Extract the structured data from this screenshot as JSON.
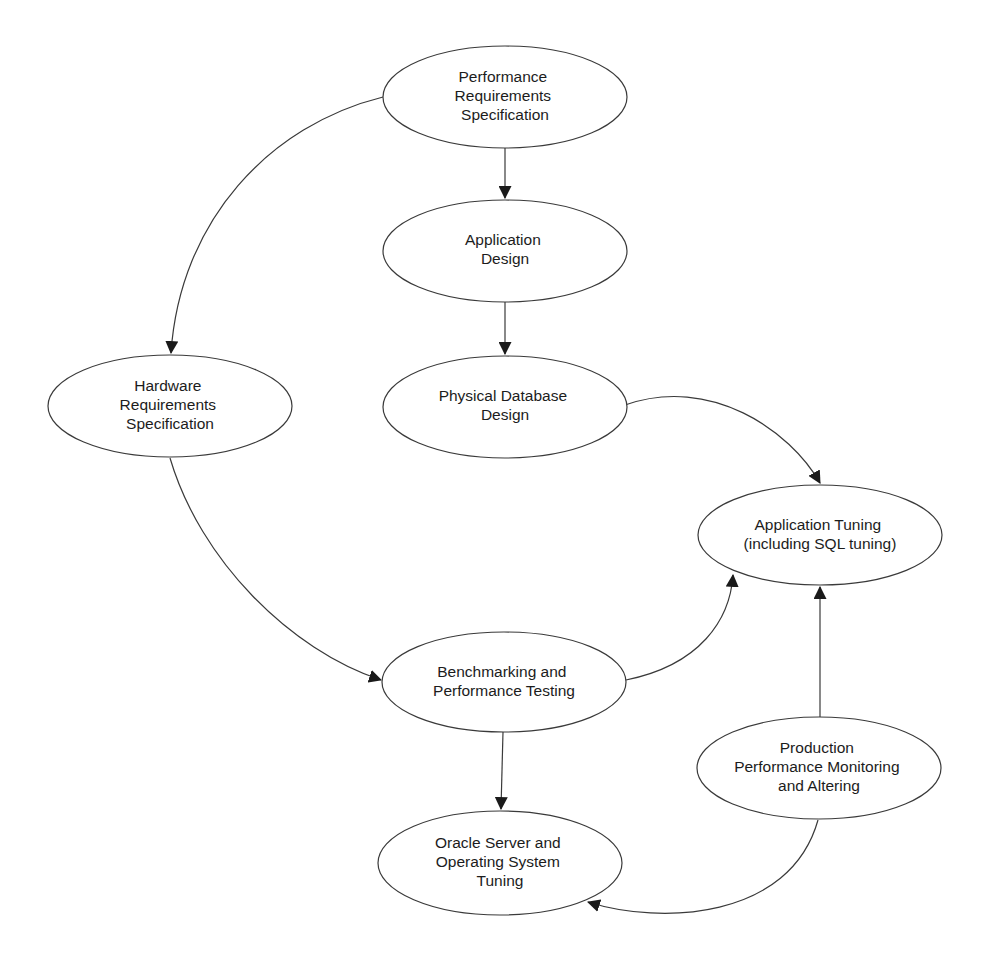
{
  "diagram": {
    "type": "flowchart",
    "style": {
      "stroke_color": "#3a3a3a",
      "text_color": "#1c1c1c",
      "background": "#ffffff"
    },
    "nodes": [
      {
        "id": "perf_req",
        "lines": [
          "Performance",
          "Requirements",
          "Specification"
        ],
        "cx": 505,
        "cy": 97,
        "rx": 122,
        "ry": 51
      },
      {
        "id": "app_design",
        "lines": [
          "Application",
          "Design"
        ],
        "cx": 505,
        "cy": 251,
        "rx": 122,
        "ry": 51
      },
      {
        "id": "phys_db",
        "lines": [
          "Physical Database",
          "Design"
        ],
        "cx": 505,
        "cy": 407,
        "rx": 122,
        "ry": 51
      },
      {
        "id": "hw_req",
        "lines": [
          "Hardware",
          "Requirements",
          "Specification"
        ],
        "cx": 170,
        "cy": 406,
        "rx": 122,
        "ry": 51
      },
      {
        "id": "app_tuning",
        "lines": [
          "Application Tuning",
          "(including SQL tuning)"
        ],
        "cx": 820,
        "cy": 535,
        "rx": 122,
        "ry": 50
      },
      {
        "id": "benchmark",
        "lines": [
          "Benchmarking and",
          "Performance Testing"
        ],
        "cx": 504,
        "cy": 682,
        "rx": 122,
        "ry": 50
      },
      {
        "id": "prod_monitor",
        "lines": [
          "Production",
          "Performance Monitoring",
          "and Altering"
        ],
        "cx": 819,
        "cy": 768,
        "rx": 122,
        "ry": 51
      },
      {
        "id": "oracle_tuning",
        "lines": [
          "Oracle Server and",
          "Operating System",
          "Tuning"
        ],
        "cx": 500,
        "cy": 863,
        "rx": 122,
        "ry": 52
      }
    ],
    "edges": [
      {
        "from": "perf_req",
        "to": "app_design",
        "path": "M505 148 L505 198"
      },
      {
        "from": "app_design",
        "to": "phys_db",
        "path": "M505 302 L505 354"
      },
      {
        "from": "perf_req",
        "to": "hw_req",
        "path": "M383 97 C 270 125, 180 220, 171 353"
      },
      {
        "from": "phys_db",
        "to": "app_tuning",
        "path": "M625 405 C 710 375, 790 430, 820 483"
      },
      {
        "from": "hw_req",
        "to": "benchmark",
        "path": "M170 458 C 200 560, 290 650, 381 680"
      },
      {
        "from": "benchmark",
        "to": "app_tuning",
        "path": "M626 680 C 700 665, 730 620, 733 575"
      },
      {
        "from": "prod_monitor",
        "to": "app_tuning",
        "path": "M820 717 L820 587"
      },
      {
        "from": "benchmark",
        "to": "oracle_tuning",
        "path": "M503 732 L501 809"
      },
      {
        "from": "prod_monitor",
        "to": "oracle_tuning",
        "path": "M818 820 C 790 920, 660 925, 588 902"
      }
    ]
  },
  "labels": {
    "perf_req": [
      "Performance",
      "Requirements",
      "Specification"
    ],
    "app_design": [
      "Application",
      "Design"
    ],
    "phys_db": [
      "Physical Database",
      "Design"
    ],
    "hw_req": [
      "Hardware",
      "Requirements",
      "Specification"
    ],
    "app_tuning": [
      "Application Tuning",
      "(including SQL tuning)"
    ],
    "benchmark": [
      "Benchmarking and",
      "Performance Testing"
    ],
    "prod_monitor": [
      "Production",
      "Performance Monitoring",
      "and Altering"
    ],
    "oracle_tuning": [
      "Oracle Server and",
      "Operating System",
      "Tuning"
    ]
  }
}
